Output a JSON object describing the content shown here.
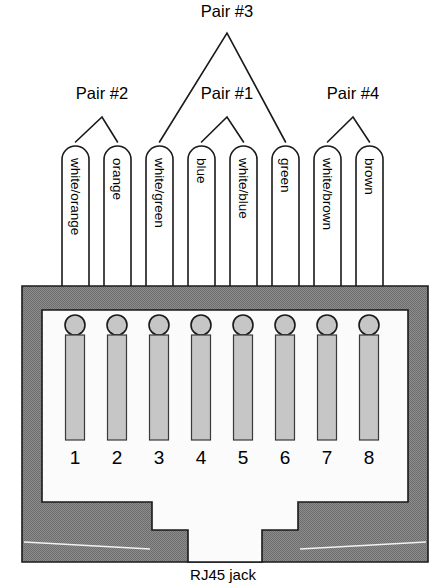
{
  "diagram": {
    "caption": "RJ45 jack",
    "colors": {
      "body_gray": "#808080",
      "pin_gray": "#c6c6c6",
      "outline": "#1a1a1a",
      "cavity_white": "#fbfbfb",
      "background": "#ffffff"
    }
  },
  "pairs": [
    {
      "label": "Pair #2",
      "apex_x": 102,
      "apex_y": 117,
      "text_x": 102,
      "text_y": 99,
      "left_pin": 1,
      "right_pin": 2
    },
    {
      "label": "Pair #3",
      "apex_x": 227,
      "apex_y": 33,
      "text_x": 227,
      "text_y": 17,
      "left_pin": 3,
      "right_pin": 6
    },
    {
      "label": "Pair #1",
      "apex_x": 227,
      "apex_y": 117,
      "text_x": 227,
      "text_y": 99,
      "left_pin": 4,
      "right_pin": 5
    },
    {
      "label": "Pair #4",
      "apex_x": 353,
      "apex_y": 117,
      "text_x": 353,
      "text_y": 99,
      "left_pin": 7,
      "right_pin": 8
    }
  ],
  "wires": [
    {
      "pin": "1",
      "color_label": "white/orange",
      "x": 62
    },
    {
      "pin": "2",
      "color_label": "orange",
      "x": 104
    },
    {
      "pin": "3",
      "color_label": "white/green",
      "x": 146
    },
    {
      "pin": "4",
      "color_label": "blue",
      "x": 188
    },
    {
      "pin": "5",
      "color_label": "white/blue",
      "x": 230
    },
    {
      "pin": "6",
      "color_label": "green",
      "x": 272
    },
    {
      "pin": "7",
      "color_label": "white/brown",
      "x": 314
    },
    {
      "pin": "8",
      "color_label": "brown",
      "x": 356
    }
  ],
  "pins": [
    {
      "number": "1",
      "cx": 75
    },
    {
      "number": "2",
      "cx": 117
    },
    {
      "number": "3",
      "cx": 159
    },
    {
      "number": "4",
      "cx": 201
    },
    {
      "number": "5",
      "cx": 243
    },
    {
      "number": "6",
      "cx": 285
    },
    {
      "number": "7",
      "cx": 327
    },
    {
      "number": "8",
      "cx": 369
    }
  ],
  "geometry": {
    "wire_width": 27,
    "wire_top": 146,
    "wire_bottom": 288,
    "wire_radius": 13.5,
    "jack_left": 22,
    "jack_top": 286,
    "jack_right": 428,
    "jack_bottom": 562,
    "cavity_left": 42,
    "cavity_top": 310,
    "cavity_right": 408,
    "cavity_bottom": 502,
    "pin_circle_cy": 325,
    "pin_circle_r": 10,
    "pin_rect_top": 335,
    "pin_rect_bottom": 440,
    "pin_rect_width": 19,
    "number_baseline": 464,
    "caption_x": 223,
    "caption_y": 580
  }
}
